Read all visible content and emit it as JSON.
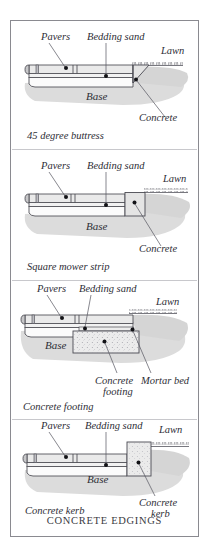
{
  "plate": {
    "title": "CONCRETE EDGINGS",
    "background_color": "#ffffff",
    "border_color": "#8a8a90"
  },
  "palette": {
    "paver_fill": "#e9e9ea",
    "paver_end_fill": "#c9c9cb",
    "bedding_sand_fill": "#f2f2f2",
    "base_fill": "#fbfbfb",
    "concrete_fill": "#e6e6e6",
    "ground_shadow": "#d8d8d8",
    "outline": "#4a4a52",
    "leader_line": "#55555e",
    "dot": "#121216",
    "text": "#2e2e36"
  },
  "diagrams": [
    {
      "id": "45-degree-buttress",
      "caption": "45 degree buttress",
      "labels": {
        "pavers": "Pavers",
        "bedding_sand": "Bedding sand",
        "lawn": "Lawn",
        "base": "Base",
        "concrete": "Concrete"
      }
    },
    {
      "id": "square-mower-strip",
      "caption": "Square mower strip",
      "labels": {
        "pavers": "Pavers",
        "bedding_sand": "Bedding sand",
        "lawn": "Lawn",
        "base": "Base",
        "concrete": "Concrete"
      }
    },
    {
      "id": "concrete-footing",
      "caption": "Concrete footing",
      "labels": {
        "pavers": "Pavers",
        "bedding_sand": "Bedding sand",
        "lawn": "Lawn",
        "base": "Base",
        "concrete_footing_line1": "Concrete",
        "concrete_footing_line2": "footing",
        "mortar_bed": "Mortar bed"
      }
    },
    {
      "id": "concrete-kerb",
      "caption": "Concrete kerb",
      "labels": {
        "pavers": "Pavers",
        "bedding_sand": "Bedding sand",
        "lawn": "Lawn",
        "base": "Base",
        "concrete_kerb_line1": "Concrete",
        "concrete_kerb_line2": "kerb"
      }
    }
  ]
}
